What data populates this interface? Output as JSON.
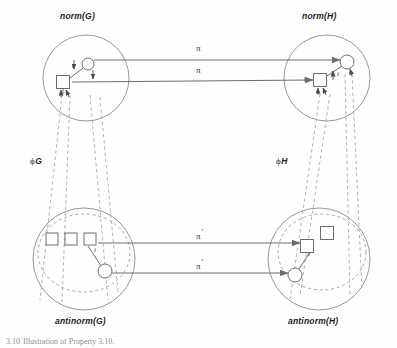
{
  "figure": {
    "caption_number": "3.10",
    "caption_text": "Illustration of Property 3.10.",
    "background": "#fefefe",
    "line_color": "#6e6e6e",
    "dash_color": "#9a9a9a",
    "text_color": "#1b1b1b"
  },
  "regions": [
    {
      "id": "norm-g",
      "label": "norm(G)",
      "cx": 86,
      "cy": 78,
      "r": 43
    },
    {
      "id": "norm-h",
      "label": "norm(H)",
      "cx": 327,
      "cy": 78,
      "r": 43
    },
    {
      "id": "antinorm-g",
      "label": "antinorm(G)",
      "cx": 84,
      "cy": 259,
      "r": 51
    },
    {
      "id": "antinorm-h",
      "label": "antinorm(H)",
      "cx": 319,
      "cy": 259,
      "r": 51
    }
  ],
  "region_labels": [
    {
      "text": "norm(G)",
      "x": 60,
      "y": 11
    },
    {
      "text": "norm(H)",
      "x": 302,
      "y": 11
    },
    {
      "text": "antinorm(G)",
      "x": 55,
      "y": 316
    },
    {
      "text": "antinorm(H)",
      "x": 288,
      "y": 316
    }
  ],
  "edge_labels": [
    {
      "id": "pi-top-1",
      "symbol": "π",
      "prime": "",
      "x": 196,
      "y": 40
    },
    {
      "id": "pi-top-2",
      "symbol": "π",
      "prime": "",
      "x": 196,
      "y": 62
    },
    {
      "id": "pi-bottom-1",
      "symbol": "π",
      "prime": "'",
      "x": 196,
      "y": 228
    },
    {
      "id": "pi-bottom-2",
      "symbol": "π",
      "prime": "'",
      "x": 196,
      "y": 271
    }
  ],
  "morphism_labels": [
    {
      "id": "phi-g",
      "symbol": "ϕ",
      "sub": "G",
      "x": 30,
      "y": 156
    },
    {
      "id": "phi-h",
      "symbol": "ϕ",
      "sub": "H",
      "x": 276,
      "y": 156
    }
  ],
  "node_labels": [
    {
      "id": "i-norm-g",
      "text": "i",
      "x": 72,
      "y": 66
    },
    {
      "id": "i-norm-h",
      "text": "i",
      "x": 337,
      "y": 70
    },
    {
      "id": "i-antinorm-g",
      "text": "i",
      "x": 94,
      "y": 248
    },
    {
      "id": "i-antinorm-h",
      "text": "i",
      "x": 310,
      "y": 250
    }
  ],
  "nodes": [
    {
      "id": "ng-circle",
      "shape": "circle",
      "cx": 88,
      "cy": 64,
      "r": 6
    },
    {
      "id": "ng-square",
      "shape": "square",
      "cx": 63,
      "cy": 82,
      "size": 13
    },
    {
      "id": "nh-circle",
      "shape": "circle",
      "cx": 347,
      "cy": 62,
      "r": 7
    },
    {
      "id": "nh-square",
      "shape": "square",
      "cx": 320,
      "cy": 80,
      "size": 13
    },
    {
      "id": "ag-square-1",
      "shape": "square",
      "cx": 52,
      "cy": 239,
      "size": 12
    },
    {
      "id": "ag-square-2",
      "shape": "square",
      "cx": 71,
      "cy": 239,
      "size": 12
    },
    {
      "id": "ag-square-3",
      "shape": "square",
      "cx": 90,
      "cy": 239,
      "size": 12
    },
    {
      "id": "ag-circle",
      "shape": "circle",
      "cx": 105,
      "cy": 271,
      "r": 7
    },
    {
      "id": "ah-square-1",
      "shape": "square",
      "cx": 327,
      "cy": 233,
      "size": 13
    },
    {
      "id": "ah-square-2",
      "shape": "square",
      "cx": 307,
      "cy": 246,
      "size": 13
    },
    {
      "id": "ah-circle",
      "shape": "circle",
      "cx": 295,
      "cy": 275,
      "r": 7
    }
  ]
}
